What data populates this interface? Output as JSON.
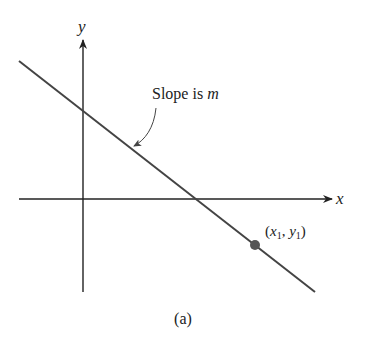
{
  "figure": {
    "caption": "(a)",
    "axes": {
      "x_label": "x",
      "y_label": "y"
    },
    "annotation": {
      "prefix": "Slope is ",
      "variable": "m"
    },
    "point": {
      "label_open": "(",
      "x_var": "x",
      "x_sub": "1",
      "sep": ", ",
      "y_var": "y",
      "y_sub": "1",
      "label_close": ")"
    },
    "colors": {
      "line": "#444444",
      "point": "#555555",
      "axes": "#222222"
    }
  }
}
